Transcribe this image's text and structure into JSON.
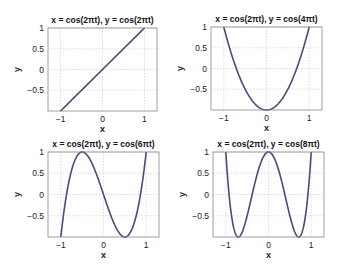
{
  "chart_data": [
    {
      "type": "line",
      "title": "x = cos(2πt), y = cos(2πt)",
      "xlabel": "x",
      "ylabel": "y",
      "xlim": [
        -1.3,
        1.3
      ],
      "ylim": [
        -1,
        1
      ],
      "xticks": [
        "-1",
        "0",
        "1"
      ],
      "yticks": [
        "1",
        "0.5",
        "0",
        "-0.5"
      ],
      "grid": true,
      "series": [
        {
          "name": "curve",
          "freq_ratio": 1,
          "x": [
            -1,
            1
          ],
          "y": [
            -1,
            1
          ]
        }
      ]
    },
    {
      "type": "line",
      "title": "x = cos(2πt), y = cos(4πt)",
      "xlabel": "x",
      "ylabel": "y",
      "xlim": [
        -1.3,
        1.3
      ],
      "ylim": [
        -1,
        1
      ],
      "xticks": [
        "-1",
        "0",
        "1"
      ],
      "yticks": [
        "1",
        "0.5",
        "0",
        "-0.5"
      ],
      "grid": true,
      "series": [
        {
          "name": "curve",
          "freq_ratio": 2,
          "x": [
            -1,
            -0.5,
            0,
            0.5,
            1
          ],
          "y": [
            1,
            -0.5,
            -1,
            -0.5,
            1
          ]
        }
      ]
    },
    {
      "type": "line",
      "title": "x = cos(2πt), y = cos(6πt)",
      "xlabel": "x",
      "ylabel": "y",
      "xlim": [
        -1.3,
        1.3
      ],
      "ylim": [
        -1,
        1
      ],
      "xticks": [
        "-1",
        "0",
        "1"
      ],
      "yticks": [
        "1",
        "0.5",
        "0",
        "-0.5"
      ],
      "grid": true,
      "series": [
        {
          "name": "curve",
          "freq_ratio": 3,
          "x": [
            -1,
            -0.5,
            0,
            0.5,
            1
          ],
          "y": [
            -1,
            1,
            0,
            -1,
            1
          ]
        }
      ]
    },
    {
      "type": "line",
      "title": "x = cos(2πt), y = cos(8πt)",
      "xlabel": "x",
      "ylabel": "y",
      "xlim": [
        -1.3,
        1.3
      ],
      "ylim": [
        -1,
        1
      ],
      "xticks": [
        "-1",
        "0",
        "1"
      ],
      "yticks": [
        "1",
        "0.5",
        "0",
        "-0.5"
      ],
      "grid": true,
      "series": [
        {
          "name": "curve",
          "freq_ratio": 4,
          "x": [
            -1,
            -0.707,
            0,
            0.707,
            1
          ],
          "y": [
            1,
            -1,
            1,
            -1,
            1
          ]
        }
      ]
    }
  ],
  "panels": [
    {
      "title": "x = cos(2πt), y = cos(2πt)",
      "xlabel": "x",
      "ylabel": "y"
    },
    {
      "title": "x = cos(2πt), y = cos(4πt)",
      "xlabel": "x",
      "ylabel": "y"
    },
    {
      "title": "x = cos(2πt), y = cos(6πt)",
      "xlabel": "x",
      "ylabel": "y"
    },
    {
      "title": "x = cos(2πt), y = cos(8πt)",
      "xlabel": "x",
      "ylabel": "y"
    }
  ],
  "ticks": {
    "x": [
      "−1",
      "0",
      "1"
    ],
    "y": [
      "1",
      "0.5",
      "0",
      "−0.5"
    ]
  },
  "colors": {
    "curve": "#4a4a7a",
    "grid": "#c8c8c8",
    "frame": "#888888"
  }
}
